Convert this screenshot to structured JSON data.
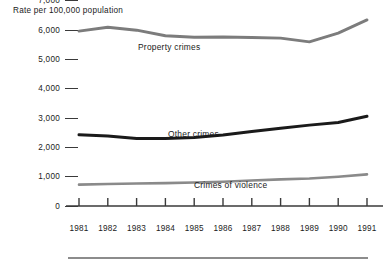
{
  "figure": {
    "y_axis_caption": "Rate per 100,000 population",
    "bottom_rule": "decorative-rule"
  },
  "chart_data": {
    "type": "line",
    "title": "",
    "subtitle": "",
    "xlabel": "",
    "ylabel": "Rate per 100,000 population",
    "grid": false,
    "legend_position": "inline-annotations",
    "xlim": [
      1981,
      1991
    ],
    "ylim": [
      0,
      7000
    ],
    "categories": [
      "1981",
      "1982",
      "1983",
      "1984",
      "1985",
      "1986",
      "1987",
      "1988",
      "1989",
      "1990",
      "1991"
    ],
    "x": [
      1981,
      1982,
      1983,
      1984,
      1985,
      1986,
      1987,
      1988,
      1989,
      1990,
      1991
    ],
    "ytick_labels": [
      "7,000",
      "6,000",
      "5,000",
      "4,000",
      "3,000",
      "2,000",
      "1,000",
      "0"
    ],
    "ytick_values": [
      7000,
      6000,
      5000,
      4000,
      3000,
      2000,
      1000,
      0
    ],
    "series": [
      {
        "name": "Property crimes",
        "color": "#7c7c7c",
        "values": [
          5970,
          6100,
          6000,
          5810,
          5760,
          5770,
          5750,
          5730,
          5600,
          5900,
          6350
        ]
      },
      {
        "name": "Other crimes",
        "color": "#1a1a1a",
        "values": [
          2430,
          2390,
          2300,
          2300,
          2340,
          2420,
          2540,
          2650,
          2760,
          2850,
          3060
        ]
      },
      {
        "name": "Crimes of violence",
        "color": "#8a8a8a",
        "values": [
          730,
          750,
          770,
          780,
          800,
          830,
          870,
          910,
          940,
          1000,
          1080
        ]
      }
    ],
    "annotations": [
      {
        "text": "Property crimes",
        "series": "Property crimes"
      },
      {
        "text": "Other crimes",
        "series": "Other crimes"
      },
      {
        "text": "Crimes of violence",
        "series": "Crimes of violence"
      }
    ]
  }
}
